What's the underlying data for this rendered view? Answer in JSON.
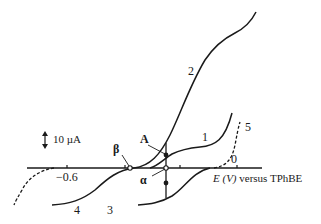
{
  "diagram": {
    "type": "voltammogram",
    "scale_bar": {
      "label": "10 µA"
    },
    "axis": {
      "label_var": "E (V)",
      "label_rest": " versus TPhBE",
      "ticks": [
        {
          "x": 67,
          "label": "−0.6"
        },
        {
          "x": 125,
          "label": ""
        },
        {
          "x": 180,
          "label": ""
        },
        {
          "x": 237,
          "label": "0"
        }
      ]
    },
    "curves": [
      {
        "id": "1",
        "label": "1"
      },
      {
        "id": "2",
        "label": "2"
      },
      {
        "id": "3",
        "label": "3"
      },
      {
        "id": "4",
        "label": "4"
      },
      {
        "id": "5",
        "label": "5",
        "style": "dashed"
      }
    ],
    "points": {
      "A": "A",
      "alpha": "α",
      "beta": "β"
    },
    "colors": {
      "ink": "#1a1a1a",
      "background": "#ffffff"
    }
  }
}
